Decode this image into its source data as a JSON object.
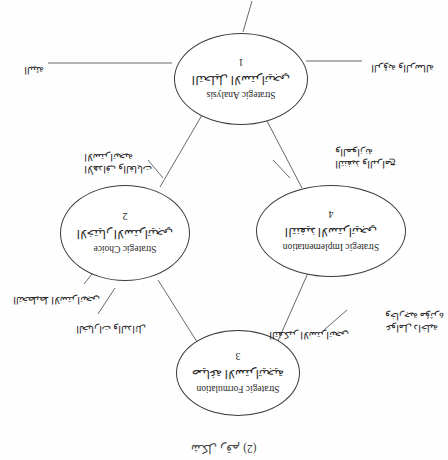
{
  "figure": {
    "title": "شكل رقم (2)",
    "orientation": "rotated-180",
    "page_background": "#fefefe",
    "line_color": "#3a3a3a"
  },
  "nodes": [
    {
      "id": "strategic-analysis",
      "number": "1",
      "label_ar": "التحليل الاستراتيجي",
      "label_en": "Strategic Analysis"
    },
    {
      "id": "strategic-choice",
      "number": "2",
      "label_ar": "الاختيار الاستراتيجي",
      "label_en": "Strategic Choice"
    },
    {
      "id": "strategic-formulation",
      "number": "3",
      "label_ar": "صياغة الاستراتيجية",
      "label_en": "Strategic Formulation"
    },
    {
      "id": "strategic-implementation",
      "number": "4",
      "label_ar": "التنفيذ الاستراتيجي",
      "label_en": "Strategic Implementation"
    }
  ],
  "captions": [
    {
      "id": "environmental-factors",
      "lines": [
        "عوامل داخلية",
        "وخارجية مؤثرة"
      ]
    },
    {
      "id": "strategic-thinking",
      "lines": [
        "التفكير الاستراتيجي"
      ]
    },
    {
      "id": "alternatives",
      "lines": [
        "الخيارات والبدائل"
      ]
    },
    {
      "id": "strategic-planning",
      "lines": [
        "التخطيط الاستراتيجي"
      ]
    },
    {
      "id": "goals-objectives",
      "lines": [
        "الأهداف والغايات",
        "الاستراتيجية"
      ]
    },
    {
      "id": "execution-programs",
      "lines": [
        "التنفيذ والبرامج",
        "والموازنة"
      ]
    },
    {
      "id": "vision-mission",
      "lines": [
        "الرؤية والرسالة"
      ]
    },
    {
      "id": "environment",
      "lines": [
        "البيئة"
      ]
    }
  ]
}
